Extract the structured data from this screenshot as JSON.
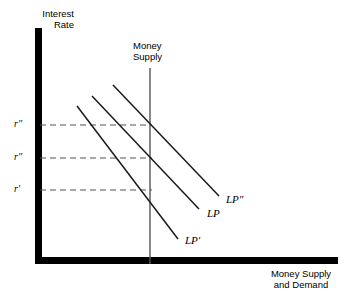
{
  "figure": {
    "width": 350,
    "height": 301,
    "background": "#ffffff",
    "axis_color": "#000000",
    "curve_color": "#1a1a1a",
    "dashed_color": "#555555"
  },
  "axes": {
    "y_title": "Interest\nRate",
    "x_title": "Money Supply\nand Demand",
    "origin": {
      "x": 36,
      "y": 264
    },
    "y_top": 28,
    "x_right": 338,
    "thickness": 7
  },
  "money_supply": {
    "label": "Money\nSupply",
    "x": 150,
    "y_top": 68,
    "y_bottom": 264,
    "color": "#555555"
  },
  "tick_labels": [
    {
      "name": "r-double-prime",
      "text": "r″",
      "x": 14,
      "y": 118,
      "line_y": 125
    },
    {
      "name": "r-star",
      "text": "r″",
      "x": 14,
      "y": 151,
      "line_y": 158
    },
    {
      "name": "r-prime",
      "text": "r′",
      "x": 14,
      "y": 183,
      "line_y": 190
    }
  ],
  "dashed_lines": [
    {
      "name": "dashed-r-double-prime",
      "y": 125,
      "x_start": 40,
      "x_end": 152
    },
    {
      "name": "dashed-r-star",
      "y": 158,
      "x_start": 40,
      "x_end": 152
    },
    {
      "name": "dashed-r-prime",
      "y": 190,
      "x_start": 40,
      "x_end": 152
    }
  ],
  "curves": [
    {
      "name": "lp-double-prime",
      "label": "LP″",
      "x1": 113,
      "y1": 85,
      "x2": 219,
      "y2": 196,
      "label_x": 226,
      "label_y": 193
    },
    {
      "name": "lp",
      "label": "LP",
      "x1": 92,
      "y1": 96,
      "x2": 199,
      "y2": 209,
      "label_x": 207,
      "label_y": 207
    },
    {
      "name": "lp-prime",
      "label": "LP′",
      "x1": 77,
      "y1": 106,
      "x2": 178,
      "y2": 239,
      "label_x": 185,
      "label_y": 234
    }
  ],
  "chart_data": {
    "type": "line",
    "title": "",
    "xlabel": "Money Supply and Demand",
    "ylabel": "Interest Rate",
    "grid": false,
    "legend": "inline-end-labels",
    "axis_ticks_x": [],
    "axis_ticks_y": [
      "r′",
      "r″",
      "r″"
    ],
    "series": [
      {
        "name": "Money Supply",
        "type": "vertical-line",
        "x": 150,
        "orientation": "vertical"
      },
      {
        "name": "LP′",
        "type": "downward-sloping-line",
        "equilibrium_rate_label": "r′"
      },
      {
        "name": "LP",
        "type": "downward-sloping-line",
        "equilibrium_rate_label": "r″"
      },
      {
        "name": "LP″",
        "type": "downward-sloping-line",
        "equilibrium_rate_label": "r″"
      }
    ]
  }
}
